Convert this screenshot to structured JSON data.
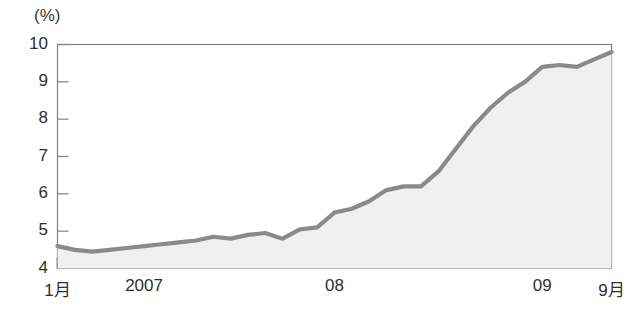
{
  "chart_data": {
    "type": "area",
    "title": "",
    "subtitle": "",
    "xlabel": "",
    "ylabel": "",
    "unit_label": "(%)",
    "ylim": [
      4,
      10
    ],
    "yticks": [
      4,
      5,
      6,
      7,
      8,
      9,
      10
    ],
    "ytick_labels": [
      "4",
      "5",
      "6",
      "7",
      "8",
      "9",
      "10"
    ],
    "grid": false,
    "legend": "none",
    "line_color": "#8a8a8a",
    "fill_color": "#f0f0f0",
    "axis_color": "#808080",
    "x": [
      "2007-01",
      "2007-02",
      "2007-03",
      "2007-04",
      "2007-05",
      "2007-06",
      "2007-07",
      "2007-08",
      "2007-09",
      "2007-10",
      "2007-11",
      "2007-12",
      "2008-01",
      "2008-02",
      "2008-03",
      "2008-04",
      "2008-05",
      "2008-06",
      "2008-07",
      "2008-08",
      "2008-09",
      "2008-10",
      "2008-11",
      "2008-12",
      "2009-01",
      "2009-02",
      "2009-03",
      "2009-04",
      "2009-05",
      "2009-06",
      "2009-07",
      "2009-08",
      "2009-09"
    ],
    "values": [
      4.6,
      4.5,
      4.45,
      4.5,
      4.55,
      4.6,
      4.65,
      4.7,
      4.75,
      4.85,
      4.8,
      4.9,
      4.95,
      4.8,
      5.05,
      5.1,
      5.5,
      5.6,
      5.8,
      6.1,
      6.2,
      6.2,
      6.6,
      7.2,
      7.8,
      8.3,
      8.7,
      9.0,
      9.4,
      9.45,
      9.4,
      9.6,
      9.8
    ],
    "xtick_labels": [
      {
        "text": "1月",
        "index": 0
      },
      {
        "text": "2007",
        "index": 5
      },
      {
        "text": "08",
        "index": 16
      },
      {
        "text": "09",
        "index": 28
      },
      {
        "text": "9月",
        "index": 32
      }
    ],
    "major_tick_indices": [
      0,
      12,
      24
    ],
    "minor_tick_indices": [
      1,
      2,
      3,
      4,
      5,
      6,
      7,
      8,
      9,
      10,
      11,
      13,
      14,
      15,
      16,
      17,
      18,
      19,
      20,
      21,
      22,
      23,
      25,
      26,
      27,
      28,
      29,
      30,
      31,
      32
    ]
  }
}
